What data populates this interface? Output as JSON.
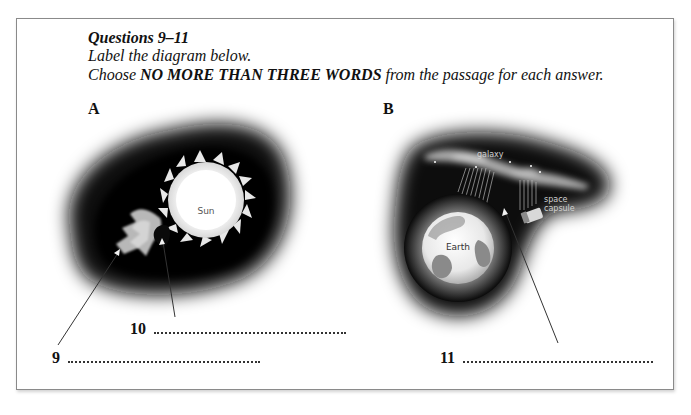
{
  "instructions": {
    "title": "Questions 9–11",
    "line1": "Label the diagram below.",
    "line2_prefix": "Choose ",
    "line2_bold": "NO MORE THAN THREE WORDS",
    "line2_suffix": " from the passage for each answer."
  },
  "diagram_a": {
    "label": "A",
    "sun_label": "Sun"
  },
  "diagram_b": {
    "label": "B",
    "galaxy_label": "galaxy",
    "capsule_label_1": "space",
    "capsule_label_2": "capsule",
    "earth_label": "Earth"
  },
  "answers": [
    {
      "number": "9",
      "value": ""
    },
    {
      "number": "10",
      "value": ""
    },
    {
      "number": "11",
      "value": ""
    }
  ],
  "colors": {
    "border": "#8a8a8a",
    "text": "#111111",
    "halo_dark": "#0a0a0a"
  }
}
